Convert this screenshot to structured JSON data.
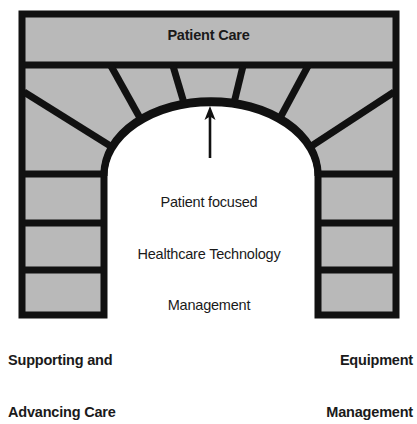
{
  "diagram": {
    "type": "arch-gateway-diagram",
    "title_top": "Patient Care",
    "center_callout": {
      "line1": "Patient focused",
      "line2": "Healthcare Technology",
      "line3": "Management",
      "arrow": "up-arrow-pointing-to-arch-keystone"
    },
    "left_pillar_label": {
      "line1": "Supporting and",
      "line2": "Advancing Care"
    },
    "right_pillar_label": {
      "line1": "Equipment",
      "line2": "Management"
    },
    "colors": {
      "stone_fill": "#b9b9b9",
      "stroke": "#111111",
      "opening_fill": "#ffffff",
      "background": "#ffffff",
      "text": "#1a1a1a"
    },
    "structure": {
      "lintel_band": "Patient Care",
      "voussoir_spokes": 6,
      "left_column_blocks": 3,
      "right_column_blocks": 3
    }
  }
}
